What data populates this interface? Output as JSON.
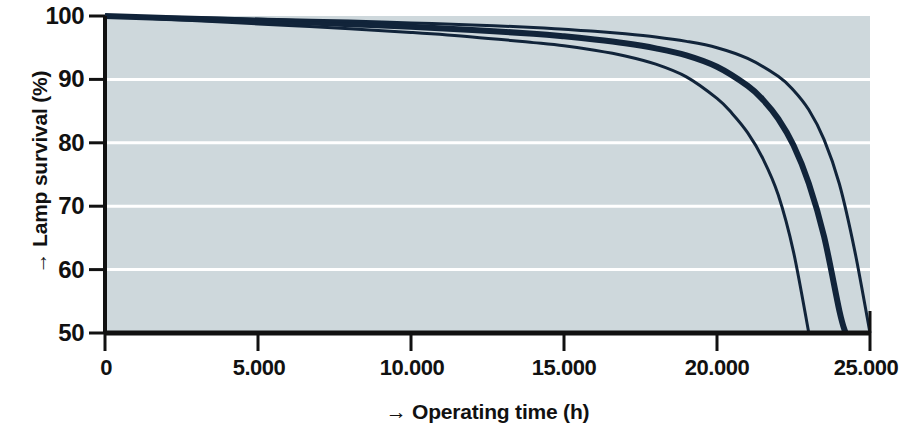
{
  "chart_data": {
    "type": "line",
    "title": "",
    "xlabel": "→ Operating time (h)",
    "ylabel": "→ Lamp survival (%)",
    "xlim": [
      0,
      25000
    ],
    "ylim": [
      50,
      100
    ],
    "grid": true,
    "grid_orientation": "horizontal",
    "legend": "none",
    "background_color": "#ced8dc",
    "gridline_color": "#ffffff",
    "line_color": "#11243a",
    "xticks": [
      0,
      5000,
      10000,
      15000,
      20000,
      25000
    ],
    "xtick_labels": [
      "0",
      "5.000",
      "10.000",
      "15.000",
      "20.000",
      "25.000"
    ],
    "yticks": [
      50,
      60,
      70,
      80,
      90,
      100
    ],
    "ytick_labels": [
      "50",
      "60",
      "70",
      "80",
      "90",
      "100"
    ],
    "series": [
      {
        "name": "curve-lower",
        "line_width": 3,
        "x": [
          0,
          2000,
          4000,
          6000,
          8000,
          10000,
          12000,
          14000,
          15000,
          16000,
          17000,
          18000,
          19000,
          20000,
          20500,
          21000,
          21500,
          22000,
          22500,
          23000
        ],
        "y": [
          100,
          99.5,
          99.0,
          98.5,
          98.0,
          97.4,
          96.7,
          95.8,
          95.3,
          94.6,
          93.7,
          92.4,
          90.4,
          87.0,
          84.6,
          81.6,
          77.5,
          71.8,
          62.8,
          50
        ]
      },
      {
        "name": "curve-middle",
        "line_width": 6,
        "x": [
          0,
          2000,
          4000,
          6000,
          8000,
          10000,
          12000,
          14000,
          15000,
          16000,
          17000,
          18000,
          19000,
          20000,
          21000,
          21500,
          22000,
          22500,
          23000,
          23500,
          24000,
          24200
        ],
        "y": [
          100,
          99.7,
          99.4,
          99.1,
          98.7,
          98.3,
          97.8,
          97.2,
          96.8,
          96.3,
          95.7,
          94.9,
          93.8,
          92.0,
          89.0,
          86.8,
          83.8,
          79.6,
          73.6,
          65.2,
          53.5,
          50
        ]
      },
      {
        "name": "curve-upper",
        "line_width": 3,
        "x": [
          0,
          2000,
          4000,
          6000,
          8000,
          10000,
          12000,
          14000,
          15000,
          16000,
          17000,
          18000,
          19000,
          20000,
          21000,
          22000,
          22500,
          23000,
          23500,
          24000,
          24500,
          25000
        ],
        "y": [
          100,
          99.8,
          99.6,
          99.4,
          99.2,
          98.9,
          98.6,
          98.2,
          97.9,
          97.6,
          97.2,
          96.7,
          96.0,
          95.0,
          93.3,
          90.5,
          88.3,
          85.2,
          80.5,
          73.5,
          63.0,
          50
        ]
      }
    ]
  }
}
